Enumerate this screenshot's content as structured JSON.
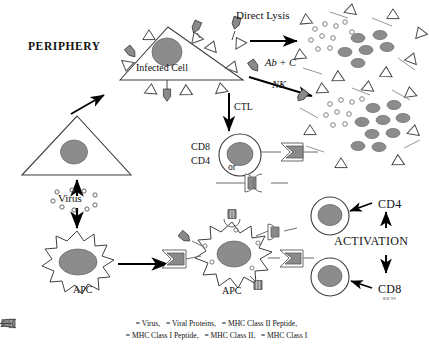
{
  "diagram": {
    "title_label": "PERIPHERY",
    "signature": "KB'99",
    "labels": {
      "infected_cell": "Infected Cell",
      "direct_lysis": "Direct Lysis",
      "ab_plus_c": "Ab + C",
      "nk": "NK",
      "ctl": "CTL",
      "cd8_upper": "CD8",
      "cd4_upper": "CD4",
      "or": "or",
      "virus": "Virus",
      "apc_lower_left": "APC",
      "apc_center": "APC",
      "cd4_right": "CD4",
      "cd8_right": "CD8",
      "activation": "ACTIVATION"
    },
    "legend": {
      "line1": [
        {
          "icon": "virus-circle-icon",
          "text": "= Virus,"
        },
        {
          "icon": "viral-protein-triangle-icon",
          "text": "= Viral Proteins,"
        },
        {
          "icon": "mhc-class-ii-peptide-icon",
          "text": "= MHC Class II Peptide,"
        }
      ],
      "line2": [
        {
          "icon": "mhc-class-i-peptide-icon",
          "text": "= MHC Class I Peptide,"
        },
        {
          "icon": "mhc-class-ii-icon",
          "text": "= MHC Class II,"
        },
        {
          "icon": "mhc-class-i-icon",
          "text": "= MHC Class I"
        }
      ]
    },
    "colors": {
      "nucleus_fill": "#8c8c8c",
      "peptide_fill": "#8a8a8a",
      "outline": "#3a3a3a",
      "arrow": "#000000",
      "background": "#ffffff"
    }
  }
}
